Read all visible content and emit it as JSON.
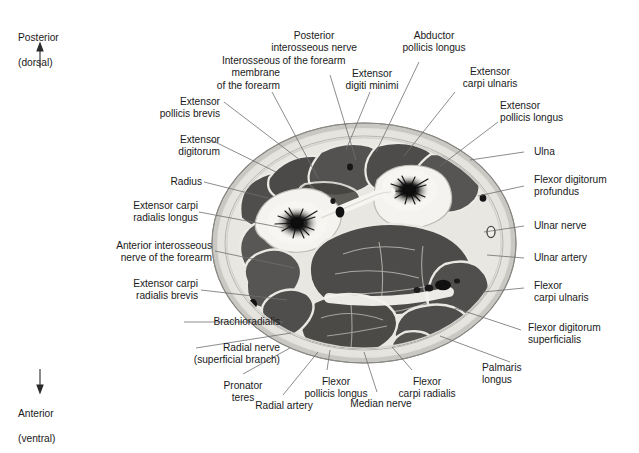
{
  "figure": {
    "type": "anatomical-cross-section",
    "region": "Forearm transverse section (proximal forearm)",
    "modality": "grayscale cadaveric cross-section photograph"
  },
  "orientation": {
    "top": {
      "line1": "Posterior",
      "line2": "(dorsal)",
      "arrow": "↑"
    },
    "bottom": {
      "line1": "Anterior",
      "line2": "(ventral)",
      "arrow": "↓"
    }
  },
  "labels": {
    "interosseous_membrane": "Interosseous\nmembrane\nof the forearm",
    "posterior_interosseous_nerve": "Posterior\ninterosseous nerve\nof the forearm",
    "extensor_digiti_minimi": "Extensor\ndigiti minimi",
    "abductor_pollicis_longus": "Abductor\npollicis longus",
    "extensor_carpi_ulnaris": "Extensor\ncarpi ulnaris",
    "extensor_pollicis_longus": "Extensor\npollicis longus",
    "extensor_pollicis_brevis": "Extensor\npollicis brevis",
    "extensor_digitorum": "Extensor\ndigitorum",
    "radius": "Radius",
    "extensor_carpi_radialis_longus": "Extensor carpi\nradialis longus",
    "anterior_interosseous_nerve": "Anterior interosseous\nnerve of the forearm",
    "extensor_carpi_radialis_brevis": "Extensor carpi\nradialis brevis",
    "brachioradialis": "Brachioradialis",
    "radial_nerve": "Radial nerve\n(superficial branch)",
    "ulna": "Ulna",
    "flexor_digitorum_profundus": "Flexor digitorum\nprofundus",
    "ulnar_nerve": "Ulnar nerve",
    "ulnar_artery": "Ulnar artery",
    "flexor_carpi_ulnaris": "Flexor\ncarpi ulnaris",
    "flexor_digitorum_superficialis": "Flexor digitorum\nsuperficialis",
    "palmaris_longus": "Palmaris\nlongus",
    "pronator_teres": "Pronator\nteres",
    "radial_artery": "Radial artery",
    "flexor_pollicis_longus": "Flexor\npollicis longus",
    "median_nerve": "Median nerve",
    "flexor_carpi_radialis": "Flexor\ncarpi radialis"
  },
  "colors": {
    "text": "#1a1a1a",
    "leader": "#6b6b6b",
    "skin": "#d8d6d2",
    "fascia": "#efeeea",
    "muscle_dark": "#4a4a4a",
    "muscle_mid": "#5d5d5d",
    "bone": "#f2f1ed",
    "marrow": "#1c1c1c"
  }
}
